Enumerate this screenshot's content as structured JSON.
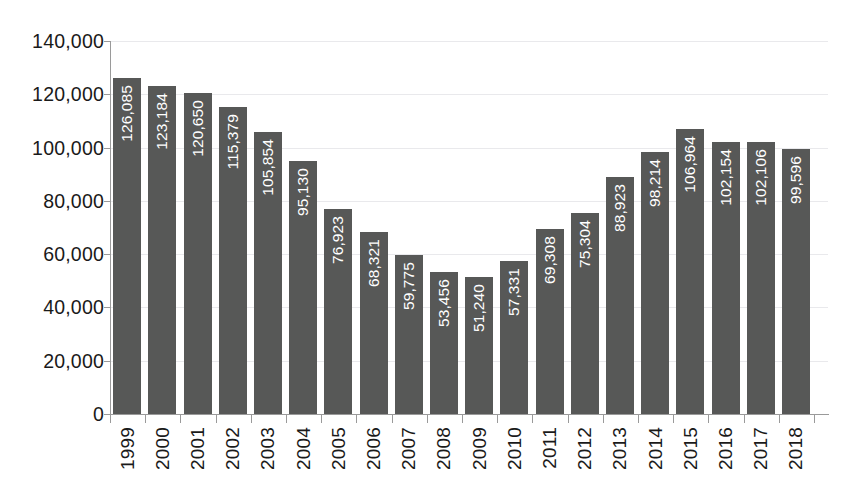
{
  "chart_data": {
    "type": "bar",
    "title": "",
    "subtitle": "",
    "xlabel": "",
    "ylabel": "",
    "categories": [
      "1999",
      "2000",
      "2001",
      "2002",
      "2003",
      "2004",
      "2005",
      "2006",
      "2007",
      "2008",
      "2009",
      "2010",
      "2011",
      "2012",
      "2013",
      "2014",
      "2015",
      "2016",
      "2017",
      "2018"
    ],
    "values": [
      126085,
      123184,
      120650,
      115379,
      105854,
      95130,
      76923,
      68321,
      59775,
      53456,
      51240,
      57331,
      69308,
      75304,
      88923,
      98214,
      106964,
      102154,
      102106,
      99596
    ],
    "value_labels": [
      "126,085",
      "123,184",
      "120,650",
      "115,379",
      "105,854",
      "95,130",
      "76,923",
      "68,321",
      "59,775",
      "53,456",
      "51,240",
      "57,331",
      "69,308",
      "75,304",
      "88,923",
      "98,214",
      "106,964",
      "102,154",
      "102,106",
      "99,596"
    ],
    "ylim": [
      0,
      140000
    ],
    "ytick_values": [
      0,
      20000,
      40000,
      60000,
      80000,
      100000,
      120000,
      140000
    ],
    "ytick_labels": [
      "0",
      "20,000",
      "40,000",
      "60,000",
      "80,000",
      "100,000",
      "120,000",
      "140,000"
    ],
    "grid": true,
    "legend": "none",
    "bar_color": "#575857",
    "value_label_color": "#ffffff",
    "gridline_color": "#e9e9ec",
    "axis_color": "#9a9a9a",
    "background_color": "#ffffff",
    "data_label_orientation": "vertical",
    "xtick_label_orientation": "vertical"
  }
}
